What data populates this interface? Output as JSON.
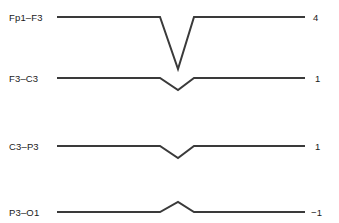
{
  "figure": {
    "width": 339,
    "height": 223,
    "background": "#ffffff",
    "trace_color": "#3a3a3a",
    "text_color": "#1a1a1a"
  },
  "chart_data": {
    "type": "line",
    "title": "",
    "subtitle": "",
    "xlabel": "",
    "ylabel": "",
    "grid": false,
    "legend": "none",
    "x": [
      0,
      0.32,
      0.41,
      0.5,
      0.59,
      0.68,
      1
    ],
    "xlim": [
      0,
      1
    ],
    "ylim": [
      -1,
      4
    ],
    "series": [
      {
        "name": "Fp1–F3",
        "label": "Fp1–F3",
        "value": "4",
        "value_numeric": 4,
        "baseline_y": 17,
        "peak_y": 69,
        "deflection": "downward",
        "amplitude_px": 52,
        "points": [
          [
            57,
            17
          ],
          [
            160,
            17
          ],
          [
            178,
            69
          ],
          [
            194,
            17
          ],
          [
            305,
            17
          ]
        ]
      },
      {
        "name": "F3–C3",
        "label": "F3–C3",
        "value": "1",
        "value_numeric": 1,
        "baseline_y": 78,
        "peak_y": 90,
        "deflection": "downward",
        "amplitude_px": 12,
        "points": [
          [
            57,
            78
          ],
          [
            160,
            78
          ],
          [
            178,
            90
          ],
          [
            194,
            78
          ],
          [
            305,
            78
          ]
        ]
      },
      {
        "name": "C3–P3",
        "label": "C3–P3",
        "value": "1",
        "value_numeric": 1,
        "baseline_y": 146,
        "peak_y": 158,
        "deflection": "downward",
        "amplitude_px": 12,
        "points": [
          [
            57,
            146
          ],
          [
            160,
            146
          ],
          [
            178,
            158
          ],
          [
            194,
            146
          ],
          [
            305,
            146
          ]
        ]
      },
      {
        "name": "P3–O1",
        "label": "P3–O1",
        "value": "−1",
        "value_numeric": -1,
        "baseline_y": 212,
        "peak_y": 202,
        "deflection": "upward",
        "amplitude_px": 10,
        "points": [
          [
            57,
            212
          ],
          [
            160,
            212
          ],
          [
            178,
            202
          ],
          [
            194,
            212
          ],
          [
            305,
            212
          ]
        ]
      }
    ]
  },
  "labels": {
    "left": [
      {
        "text": "Fp1–F3",
        "x": 9,
        "y": 13
      },
      {
        "text": "F3–C3",
        "x": 9,
        "y": 74
      },
      {
        "text": "C3–P3",
        "x": 9,
        "y": 142
      },
      {
        "text": "P3–O1",
        "x": 9,
        "y": 208
      }
    ],
    "right": [
      {
        "text": "4",
        "x": 313,
        "y": 13
      },
      {
        "text": "1",
        "x": 315,
        "y": 74
      },
      {
        "text": "1",
        "x": 315,
        "y": 142
      },
      {
        "text": "−1",
        "x": 311,
        "y": 208
      }
    ]
  }
}
